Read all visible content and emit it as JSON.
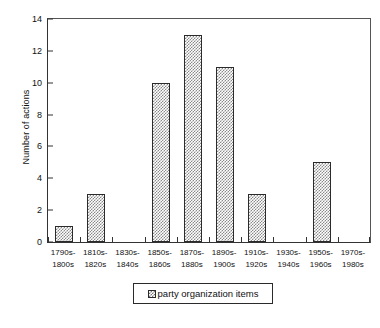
{
  "chart_data": {
    "type": "bar",
    "title": "",
    "xlabel": "",
    "ylabel": "Number of actions",
    "categories": [
      "1790s-\n1800s",
      "1810s-\n1820s",
      "1830s-\n1840s",
      "1850s-\n1860s",
      "1870s-\n1880s",
      "1890s-\n1900s",
      "1910s-\n1920s",
      "1930s-\n1940s",
      "1950s-\n1960s",
      "1970s-\n1980s"
    ],
    "category_lines": [
      [
        "1790s-",
        "1800s"
      ],
      [
        "1810s-",
        "1820s"
      ],
      [
        "1830s-",
        "1840s"
      ],
      [
        "1850s-",
        "1860s"
      ],
      [
        "1870s-",
        "1880s"
      ],
      [
        "1890s-",
        "1900s"
      ],
      [
        "1910s-",
        "1920s"
      ],
      [
        "1930s-",
        "1940s"
      ],
      [
        "1950s-",
        "1960s"
      ],
      [
        "1970s-",
        "1980s"
      ]
    ],
    "values": [
      1,
      3,
      0,
      10,
      13,
      11,
      3,
      0,
      5,
      0
    ],
    "ylim": [
      0,
      14
    ],
    "yticks": [
      0,
      2,
      4,
      6,
      8,
      10,
      12,
      14
    ],
    "ytick_labels": [
      "0",
      "2",
      "4",
      "6",
      "8",
      "10",
      "12",
      "14"
    ],
    "grid": false,
    "legend": {
      "position": "bottom",
      "entries": [
        {
          "label": "party organization items",
          "swatch": "hatched-gray"
        }
      ]
    },
    "series": [
      {
        "name": "party organization items",
        "values": [
          1,
          3,
          0,
          10,
          13,
          11,
          3,
          0,
          5,
          0
        ]
      }
    ]
  },
  "colors": {
    "axis": "#333333",
    "bar_outline": "#2b2b2b",
    "bar_fill": "#8a8a8a",
    "background": "#ffffff",
    "text": "#111111"
  }
}
